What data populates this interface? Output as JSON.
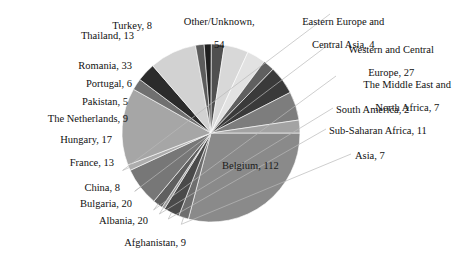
{
  "chart_data": {
    "type": "pie",
    "title": "",
    "xlabel": "",
    "ylabel": "",
    "legend_position": "none",
    "grid": false,
    "total": 385,
    "start_angle_deg": 0,
    "direction": "clockwise",
    "categories": [
      "Belgium",
      "Asia",
      "Sub-Saharan Africa",
      "South America",
      "The Middle East and North Africa",
      "Western and Central Europe",
      "Eastern Europe and Central Asia",
      "Other/Unknown",
      "Turkey",
      "Thailand",
      "Romania",
      "Portugal",
      "Pakistan",
      "The Netherlands",
      "Hungary",
      "France",
      "China",
      "Bulgaria",
      "Albania",
      "Afghanistan"
    ],
    "values": [
      112,
      7,
      11,
      2,
      7,
      27,
      4,
      54,
      8,
      13,
      33,
      6,
      5,
      9,
      17,
      13,
      8,
      20,
      20,
      9
    ],
    "slices": [
      {
        "label": "Belgium",
        "value": 112,
        "text": "Belgium, 112",
        "color": "#8a8a8a",
        "label_placement": "inside"
      },
      {
        "label": "Asia",
        "value": 7,
        "text": "Asia, 7",
        "color": "#6e6e6e",
        "label_placement": "leader-right"
      },
      {
        "label": "Sub-Saharan Africa",
        "value": 11,
        "text": "Sub-Saharan Africa, 11",
        "color": "#4a4a4a",
        "label_placement": "leader-right"
      },
      {
        "label": "South America",
        "value": 2,
        "text": "South America, 2",
        "color": "#9a9a9a",
        "label_placement": "leader-right"
      },
      {
        "label": "The Middle East and North Africa",
        "value": 7,
        "text": "The Middle East and North Africa, 7",
        "color": "#5f5f5f",
        "label_placement": "leader-right"
      },
      {
        "label": "Western and Central Europe",
        "value": 27,
        "text": "Western and Central Europe, 27",
        "color": "#777777",
        "label_placement": "leader-right"
      },
      {
        "label": "Eastern Europe and Central Asia",
        "value": 4,
        "text": "Eastern Europe and Central Asia, 4",
        "color": "#adadad",
        "label_placement": "leader-right"
      },
      {
        "label": "Other/Unknown",
        "value": 54,
        "text": "Other/Unknown, 54",
        "color": "#a6a6a6",
        "label_placement": "outside-top"
      },
      {
        "label": "Turkey",
        "value": 8,
        "text": "Turkey, 8",
        "color": "#707070",
        "label_placement": "outside-top"
      },
      {
        "label": "Thailand",
        "value": 13,
        "text": "Thailand, 13",
        "color": "#2b2b2b",
        "label_placement": "outside-left"
      },
      {
        "label": "Romania",
        "value": 33,
        "text": "Romania, 33",
        "color": "#d2d2d2",
        "label_placement": "outside-left"
      },
      {
        "label": "Portugal",
        "value": 6,
        "text": "Portugal, 6",
        "color": "#5c5c5c",
        "label_placement": "outside-left"
      },
      {
        "label": "Pakistan",
        "value": 5,
        "text": "Pakistan, 5",
        "color": "#1f1f1f",
        "label_placement": "outside-left"
      },
      {
        "label": "The Netherlands",
        "value": 9,
        "text": "The Netherlands, 9",
        "color": "#4f4f4f",
        "label_placement": "outside-left"
      },
      {
        "label": "Hungary",
        "value": 17,
        "text": "Hungary, 17",
        "color": "#d8d8d8",
        "label_placement": "outside-left"
      },
      {
        "label": "France",
        "value": 13,
        "text": "France, 13",
        "color": "#e2e2e2",
        "label_placement": "outside-left"
      },
      {
        "label": "China",
        "value": 8,
        "text": "China, 8",
        "color": "#606060",
        "label_placement": "outside-left"
      },
      {
        "label": "Bulgaria",
        "value": 20,
        "text": "Bulgaria, 20",
        "color": "#3a3a3a",
        "label_placement": "outside-left"
      },
      {
        "label": "Albania",
        "value": 20,
        "text": "Albania, 20",
        "color": "#7d7d7d",
        "label_placement": "outside-bottom"
      },
      {
        "label": "Afghanistan",
        "value": 9,
        "text": "Afghanistan, 9",
        "color": "#a3a3a3",
        "label_placement": "outside-bottom"
      }
    ],
    "geometry": {
      "cx": 211,
      "cy": 133,
      "r": 89
    }
  },
  "labels": {
    "other_unknown_line1": "Other/Unknown,",
    "other_unknown_line2": "54",
    "eastern_europe_line1": "Eastern Europe and",
    "eastern_europe_line2": "Central Asia, 4",
    "western_europe_line1": "Western and Central",
    "western_europe_line2": "Europe, 27",
    "middle_east_line1": "The Middle East and",
    "middle_east_line2": "North Africa, 7",
    "south_america": "South America, 2",
    "sub_saharan": "Sub-Saharan Africa, 11",
    "asia": "Asia, 7",
    "belgium": "Belgium, 112",
    "turkey": "Turkey, 8",
    "thailand": "Thailand, 13",
    "romania": "Romania, 33",
    "portugal": "Portugal, 6",
    "pakistan": "Pakistan, 5",
    "netherlands": "The Netherlands, 9",
    "hungary": "Hungary, 17",
    "france": "France, 13",
    "china": "China, 8",
    "bulgaria": "Bulgaria, 20",
    "albania": "Albania, 20",
    "afghanistan": "Afghanistan, 9"
  },
  "colors": {
    "background": "#ffffff",
    "text": "#111111",
    "leader_line": "#b9b9b9"
  }
}
